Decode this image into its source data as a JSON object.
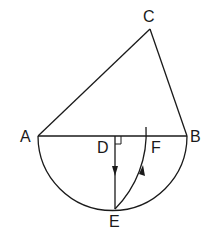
{
  "diagram": {
    "type": "geometry",
    "points": {
      "A": {
        "label": "A",
        "x": 38,
        "y": 136
      },
      "B": {
        "label": "B",
        "x": 187,
        "y": 136
      },
      "C": {
        "label": "C",
        "x": 150,
        "y": 29
      },
      "D": {
        "label": "D",
        "x": 115,
        "y": 136
      },
      "E": {
        "label": "E",
        "x": 115,
        "y": 209
      },
      "F": {
        "label": "F",
        "x": 145,
        "y": 136
      }
    },
    "segments": [
      "AC",
      "CB",
      "AB",
      "DE"
    ],
    "arcs": [
      "semicircle AEB (diameter AB)",
      "arc EF (center A)"
    ],
    "annotations": [
      "right angle at D",
      "arrow on DE pointing toward E",
      "arrow on arc EF pointing toward F"
    ],
    "colors": {
      "stroke": "#1a1a1a",
      "background": "#ffffff"
    }
  }
}
